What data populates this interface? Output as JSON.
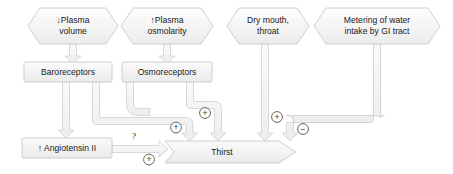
{
  "diagram": {
    "background": "#ffffff",
    "shape_fill": "#f2f2f2",
    "shape_stroke": "#c9c9c9",
    "connector_fill": "#f4f4f4",
    "connector_stroke": "#cfcfcf",
    "text_color": "#1a1a1a",
    "nodes": {
      "plasma_volume": {
        "label": "↓Plasma volume",
        "line1": "↓Plasma",
        "line2": "volume",
        "shape": "hexagon"
      },
      "plasma_osmolarity": {
        "label": "↑Plasma osmolarity",
        "line1": "↑Plasma",
        "line2": "osmolarity",
        "shape": "hexagon"
      },
      "dry_mouth": {
        "label": "Dry mouth, throat",
        "line1": "Dry mouth,",
        "line2": "throat",
        "shape": "hexagon"
      },
      "gi_metering": {
        "label": "Metering of water intake by GI tract",
        "line1": "Metering of water",
        "line2": "intake by GI tract",
        "shape": "hexagon"
      },
      "baroreceptors": {
        "label": "Baroreceptors",
        "shape": "rectangle"
      },
      "osmoreceptors": {
        "label": "Osmoreceptors",
        "shape": "rectangle"
      },
      "angiotensin": {
        "label": "↑ Angiotensin II",
        "shape": "rectangle"
      },
      "thirst": {
        "label": "Thirst",
        "shape": "banner-arrow"
      }
    },
    "signs": {
      "angiotensin_to_thirst": "+",
      "baroreceptors_to_thirst": "+",
      "osmoreceptors_to_thirst": "+",
      "dry_mouth_to_thirst": "+",
      "gi_metering_to_thirst": "−"
    },
    "annotations": {
      "unknown_link": "?"
    }
  }
}
